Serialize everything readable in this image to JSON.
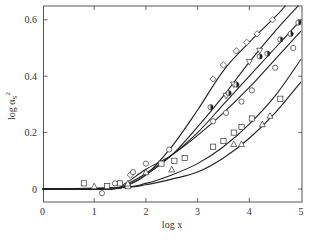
{
  "chart_data": {
    "type": "scatter",
    "title": "",
    "xlabel": "log x",
    "ylabel": "log α_S²",
    "xlim": [
      0,
      5
    ],
    "ylim": [
      -0.05,
      0.66
    ],
    "xticks": [
      0,
      1,
      2,
      3,
      4,
      5
    ],
    "yticks": [
      0,
      0.2,
      0.4,
      0.6
    ],
    "xtick_labels": [
      "0",
      "1",
      "2",
      "3",
      "4",
      "5"
    ],
    "ytick_labels": [
      "0",
      "0.2",
      "0.4",
      "0.6"
    ],
    "grid": false,
    "legend": null,
    "curves": [
      {
        "name": "curve-1",
        "x": [
          0,
          1.3,
          1.6,
          2.0,
          2.5,
          3.0,
          3.5,
          4.0,
          4.5,
          4.7
        ],
        "y": [
          0,
          0,
          0.01,
          0.05,
          0.15,
          0.28,
          0.42,
          0.52,
          0.61,
          0.65
        ]
      },
      {
        "name": "curve-2",
        "x": [
          0,
          1.3,
          1.6,
          2.0,
          2.5,
          3.0,
          3.5,
          4.0,
          4.5,
          4.95
        ],
        "y": [
          0,
          0,
          0.01,
          0.05,
          0.12,
          0.22,
          0.33,
          0.45,
          0.56,
          0.65
        ]
      },
      {
        "name": "curve-3",
        "x": [
          0,
          1.3,
          1.6,
          2.0,
          2.5,
          3.0,
          3.5,
          4.0,
          4.5,
          5.0
        ],
        "y": [
          0,
          0,
          0.015,
          0.055,
          0.12,
          0.2,
          0.3,
          0.4,
          0.5,
          0.6
        ]
      },
      {
        "name": "curve-4",
        "x": [
          0,
          1.3,
          1.6,
          2.0,
          2.5,
          3.0,
          3.5,
          4.0,
          4.5,
          5.0
        ],
        "y": [
          0,
          0,
          0.02,
          0.07,
          0.12,
          0.19,
          0.27,
          0.36,
          0.46,
          0.56
        ]
      },
      {
        "name": "curve-5",
        "x": [
          0,
          1.5,
          2.0,
          2.5,
          3.0,
          3.5,
          4.0,
          4.5,
          5.0
        ],
        "y": [
          0,
          0.005,
          0.02,
          0.05,
          0.09,
          0.15,
          0.23,
          0.33,
          0.46
        ]
      },
      {
        "name": "curve-6",
        "x": [
          0,
          1.5,
          2.0,
          2.5,
          3.0,
          3.5,
          4.0,
          4.5,
          5.0
        ],
        "y": [
          0,
          0.005,
          0.015,
          0.035,
          0.06,
          0.11,
          0.18,
          0.27,
          0.38
        ]
      }
    ],
    "series": [
      {
        "name": "diamonds",
        "marker": "diamond",
        "x": [
          1.7,
          3.3,
          3.5,
          3.75,
          3.95,
          4.15,
          4.45
        ],
        "y": [
          0.05,
          0.39,
          0.44,
          0.49,
          0.52,
          0.55,
          0.6
        ]
      },
      {
        "name": "inverted-triangles",
        "marker": "triangle-down",
        "x": [
          3.55,
          3.7,
          4.0,
          4.2
        ],
        "y": [
          0.33,
          0.37,
          0.45,
          0.49
        ]
      },
      {
        "name": "half-filled-circles",
        "marker": "half-circle",
        "x": [
          3.25,
          3.6,
          3.75,
          4.2,
          4.35,
          4.6,
          4.8,
          4.95
        ],
        "y": [
          0.29,
          0.34,
          0.37,
          0.47,
          0.48,
          0.53,
          0.55,
          0.59
        ]
      },
      {
        "name": "circles",
        "marker": "circle",
        "x": [
          1.15,
          1.4,
          1.75,
          2.0,
          2.45,
          3.3,
          3.55,
          3.85,
          4.05,
          4.5,
          4.85
        ],
        "y": [
          -0.015,
          0.02,
          0.06,
          0.09,
          0.14,
          0.24,
          0.27,
          0.31,
          0.35,
          0.43,
          0.5
        ]
      },
      {
        "name": "squares",
        "marker": "square",
        "x": [
          0.8,
          1.25,
          1.5,
          1.65,
          2.3,
          2.55,
          2.75,
          3.3,
          3.5,
          3.7,
          3.85,
          4.05,
          4.6
        ],
        "y": [
          0.02,
          0.01,
          0.02,
          0.01,
          0.09,
          0.1,
          0.11,
          0.15,
          0.17,
          0.2,
          0.22,
          0.25,
          0.32
        ]
      },
      {
        "name": "triangles",
        "marker": "triangle-up",
        "x": [
          1.0,
          1.65,
          2.0,
          2.5,
          3.7,
          3.85,
          4.25,
          4.4
        ],
        "y": [
          0.01,
          0.02,
          0.06,
          0.07,
          0.16,
          0.16,
          0.23,
          0.26
        ]
      }
    ]
  },
  "axes": {
    "xlabel_text": "log x",
    "ylabel_text": "log α",
    "ylabel_sub": "S",
    "ylabel_sup": "2"
  }
}
